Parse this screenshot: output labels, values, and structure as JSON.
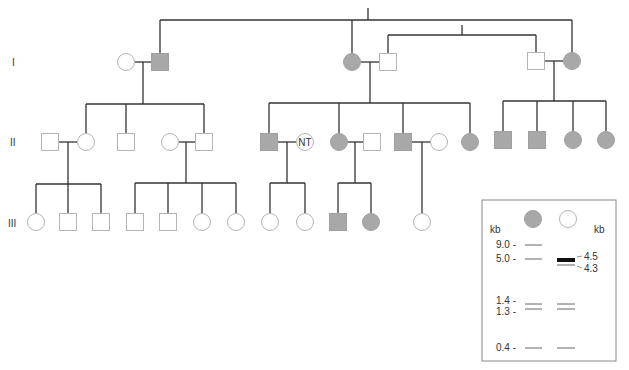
{
  "colors": {
    "line": "#333333",
    "affected_fill": "#a8a8a8",
    "affected_stroke": "#a0a0a0",
    "unaffected_fill": "#ffffff",
    "unaffected_stroke": "#b4b4b4",
    "text": "#333333",
    "gel_border": "#888888",
    "band": "#555555",
    "band_strong": "#111111"
  },
  "generation_labels": [
    {
      "label": "I",
      "x": 12,
      "y": 66
    },
    {
      "label": "II",
      "x": 10,
      "y": 146
    },
    {
      "label": "III",
      "x": 8,
      "y": 227
    }
  ],
  "individuals": [
    {
      "id": "I-1",
      "gen": "I",
      "sex": "female",
      "affected": false,
      "x": 126,
      "y": 62
    },
    {
      "id": "I-2",
      "gen": "I",
      "sex": "male",
      "affected": true,
      "x": 160,
      "y": 62
    },
    {
      "id": "I-3",
      "gen": "I",
      "sex": "female",
      "affected": true,
      "x": 352,
      "y": 62
    },
    {
      "id": "I-4",
      "gen": "I",
      "sex": "male",
      "affected": false,
      "x": 388,
      "y": 62
    },
    {
      "id": "I-5",
      "gen": "I",
      "sex": "male",
      "affected": false,
      "x": 536,
      "y": 61
    },
    {
      "id": "I-6",
      "gen": "I",
      "sex": "female",
      "affected": true,
      "x": 572,
      "y": 61
    },
    {
      "id": "II-1",
      "gen": "II",
      "sex": "male",
      "affected": false,
      "x": 50,
      "y": 142
    },
    {
      "id": "II-2",
      "gen": "II",
      "sex": "female",
      "affected": false,
      "x": 86,
      "y": 142
    },
    {
      "id": "II-3",
      "gen": "II",
      "sex": "male",
      "affected": false,
      "x": 126,
      "y": 142
    },
    {
      "id": "II-4",
      "gen": "II",
      "sex": "female",
      "affected": false,
      "x": 170,
      "y": 142
    },
    {
      "id": "II-5",
      "gen": "II",
      "sex": "male",
      "affected": false,
      "x": 204,
      "y": 142
    },
    {
      "id": "II-6",
      "gen": "II",
      "sex": "male",
      "affected": true,
      "x": 269,
      "y": 142
    },
    {
      "id": "II-7",
      "gen": "II",
      "sex": "female",
      "affected": false,
      "x": 305,
      "y": 142,
      "label": "NT"
    },
    {
      "id": "II-8",
      "gen": "II",
      "sex": "female",
      "affected": true,
      "x": 339,
      "y": 142
    },
    {
      "id": "II-9",
      "gen": "II",
      "sex": "male",
      "affected": false,
      "x": 372,
      "y": 142
    },
    {
      "id": "II-10",
      "gen": "II",
      "sex": "male",
      "affected": true,
      "x": 403,
      "y": 142
    },
    {
      "id": "II-11",
      "gen": "II",
      "sex": "female",
      "affected": false,
      "x": 439,
      "y": 142
    },
    {
      "id": "II-12",
      "gen": "II",
      "sex": "female",
      "affected": true,
      "x": 470,
      "y": 142
    },
    {
      "id": "II-13",
      "gen": "II",
      "sex": "male",
      "affected": true,
      "x": 503,
      "y": 140
    },
    {
      "id": "II-14",
      "gen": "II",
      "sex": "male",
      "affected": true,
      "x": 537,
      "y": 140
    },
    {
      "id": "II-15",
      "gen": "II",
      "sex": "female",
      "affected": true,
      "x": 573,
      "y": 140
    },
    {
      "id": "II-16",
      "gen": "II",
      "sex": "female",
      "affected": true,
      "x": 606,
      "y": 140
    },
    {
      "id": "III-1",
      "gen": "III",
      "sex": "female",
      "affected": false,
      "x": 36,
      "y": 222
    },
    {
      "id": "III-2",
      "gen": "III",
      "sex": "male",
      "affected": false,
      "x": 68,
      "y": 222
    },
    {
      "id": "III-3",
      "gen": "III",
      "sex": "male",
      "affected": false,
      "x": 101,
      "y": 222
    },
    {
      "id": "III-4",
      "gen": "III",
      "sex": "male",
      "affected": false,
      "x": 135,
      "y": 222
    },
    {
      "id": "III-5",
      "gen": "III",
      "sex": "male",
      "affected": false,
      "x": 168,
      "y": 222
    },
    {
      "id": "III-6",
      "gen": "III",
      "sex": "female",
      "affected": false,
      "x": 202,
      "y": 222
    },
    {
      "id": "III-7",
      "gen": "III",
      "sex": "female",
      "affected": false,
      "x": 236,
      "y": 222
    },
    {
      "id": "III-8",
      "gen": "III",
      "sex": "female",
      "affected": false,
      "x": 270,
      "y": 222
    },
    {
      "id": "III-9",
      "gen": "III",
      "sex": "female",
      "affected": false,
      "x": 305,
      "y": 222
    },
    {
      "id": "III-10",
      "gen": "III",
      "sex": "male",
      "affected": true,
      "x": 338,
      "y": 222
    },
    {
      "id": "III-11",
      "gen": "III",
      "sex": "female",
      "affected": true,
      "x": 371,
      "y": 222
    },
    {
      "id": "III-12",
      "gen": "III",
      "sex": "female",
      "affected": false,
      "x": 422,
      "y": 222
    }
  ],
  "lines": [
    [
      368,
      8,
      368,
      20
    ],
    [
      160,
      20,
      572,
      20
    ],
    [
      160,
      20,
      160,
      53
    ],
    [
      352,
      20,
      352,
      53
    ],
    [
      572,
      20,
      572,
      52
    ],
    [
      462,
      25,
      462,
      35
    ],
    [
      388,
      35,
      536,
      35
    ],
    [
      388,
      35,
      388,
      53
    ],
    [
      536,
      35,
      536,
      52
    ],
    [
      135,
      62,
      151,
      62
    ],
    [
      143,
      62,
      143,
      104
    ],
    [
      86,
      104,
      204,
      104
    ],
    [
      86,
      104,
      86,
      133
    ],
    [
      126,
      104,
      126,
      133
    ],
    [
      204,
      104,
      204,
      133
    ],
    [
      361,
      62,
      379,
      62
    ],
    [
      370,
      62,
      370,
      103
    ],
    [
      269,
      103,
      470,
      103
    ],
    [
      269,
      103,
      269,
      133
    ],
    [
      339,
      103,
      339,
      133
    ],
    [
      403,
      103,
      403,
      133
    ],
    [
      470,
      103,
      470,
      133
    ],
    [
      545,
      61,
      563,
      61
    ],
    [
      554,
      61,
      554,
      101
    ],
    [
      503,
      101,
      606,
      101
    ],
    [
      503,
      101,
      503,
      131
    ],
    [
      537,
      101,
      537,
      131
    ],
    [
      573,
      101,
      573,
      131
    ],
    [
      606,
      101,
      606,
      131
    ],
    [
      59,
      142,
      77,
      142
    ],
    [
      68,
      142,
      68,
      184
    ],
    [
      36,
      184,
      101,
      184
    ],
    [
      36,
      184,
      36,
      213
    ],
    [
      68,
      184,
      68,
      213
    ],
    [
      101,
      184,
      101,
      213
    ],
    [
      179,
      142,
      195,
      142
    ],
    [
      186,
      142,
      186,
      183
    ],
    [
      135,
      183,
      236,
      183
    ],
    [
      135,
      183,
      135,
      213
    ],
    [
      168,
      183,
      168,
      213
    ],
    [
      202,
      183,
      202,
      213
    ],
    [
      236,
      183,
      236,
      213
    ],
    [
      278,
      142,
      296,
      142
    ],
    [
      287,
      142,
      287,
      183
    ],
    [
      270,
      183,
      305,
      183
    ],
    [
      270,
      183,
      270,
      213
    ],
    [
      305,
      183,
      305,
      213
    ],
    [
      348,
      142,
      363,
      142
    ],
    [
      355,
      142,
      355,
      183
    ],
    [
      338,
      183,
      371,
      183
    ],
    [
      338,
      183,
      338,
      213
    ],
    [
      371,
      183,
      371,
      213
    ],
    [
      412,
      142,
      430,
      142
    ],
    [
      422,
      142,
      422,
      213
    ]
  ],
  "gel": {
    "box": {
      "x": 482,
      "y": 200,
      "w": 134,
      "h": 161
    },
    "lane_headers": [
      {
        "sex": "female",
        "affected": true,
        "x": 533,
        "y": 219
      },
      {
        "sex": "female",
        "affected": false,
        "x": 568,
        "y": 219
      }
    ],
    "left_unit": {
      "label": "kb",
      "x": 490,
      "y": 233
    },
    "right_unit": {
      "label": "kb",
      "x": 594,
      "y": 233
    },
    "left_markers": [
      {
        "label": "9.0 -",
        "y": 248
      },
      {
        "label": "5.0 -",
        "y": 262
      },
      {
        "label": "1.4 -",
        "y": 304
      },
      {
        "label": "1.3 -",
        "y": 315
      },
      {
        "label": "0.4 -",
        "y": 351
      }
    ],
    "right_markers": [
      {
        "label": "4.5",
        "y": 260,
        "tick_y": 257
      },
      {
        "label": "4.3",
        "y": 272,
        "tick_y": 266
      }
    ],
    "bands": [
      {
        "lane": 1,
        "size_kb": 9.0,
        "y": 245,
        "weight": 1
      },
      {
        "lane": 1,
        "size_kb": 5.0,
        "y": 259,
        "weight": 1
      },
      {
        "lane": 1,
        "size_kb": 1.4,
        "y": 304,
        "weight": 1
      },
      {
        "lane": 1,
        "size_kb": 1.3,
        "y": 309,
        "weight": 1
      },
      {
        "lane": 1,
        "size_kb": 0.4,
        "y": 348,
        "weight": 1
      },
      {
        "lane": 2,
        "size_kb": 4.5,
        "y": 260,
        "weight": 4
      },
      {
        "lane": 2,
        "size_kb": 4.3,
        "y": 265,
        "weight": 1
      },
      {
        "lane": 2,
        "size_kb": 1.4,
        "y": 304,
        "weight": 1
      },
      {
        "lane": 2,
        "size_kb": 1.3,
        "y": 309,
        "weight": 1
      },
      {
        "lane": 2,
        "size_kb": 0.4,
        "y": 348,
        "weight": 1
      }
    ],
    "lanes": {
      "1": [
        525,
        542
      ],
      "2": [
        557,
        575
      ]
    }
  }
}
